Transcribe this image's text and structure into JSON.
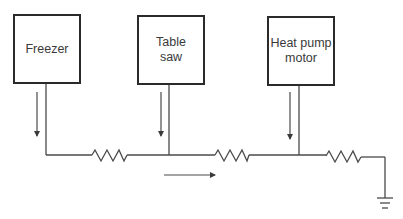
{
  "diagram": {
    "type": "circuit-schematic",
    "colors": {
      "line": "#4a4a4a",
      "box_border": "#2a2a2a",
      "text": "#3a3a3a",
      "background": "#ffffff"
    },
    "devices": [
      {
        "id": "freezer",
        "label": "Freezer",
        "box": {
          "x": 13,
          "y": 14,
          "w": 68,
          "h": 70
        },
        "wire_x": 46,
        "arrow_x": 37
      },
      {
        "id": "table-saw",
        "label": "Table\nsaw",
        "box": {
          "x": 137,
          "y": 15,
          "w": 68,
          "h": 70
        },
        "wire_x": 169,
        "arrow_x": 161
      },
      {
        "id": "heat-pump-motor",
        "label": "Heat pump\nmotor",
        "box": {
          "x": 267,
          "y": 16,
          "w": 68,
          "h": 70
        },
        "wire_x": 299,
        "arrow_x": 290
      }
    ],
    "resistors": [
      {
        "id": "r1",
        "x_start": 92,
        "x_end": 127
      },
      {
        "id": "r2",
        "x_start": 215,
        "x_end": 249
      },
      {
        "id": "r3",
        "x_start": 326,
        "x_end": 361
      }
    ],
    "bus_y": 155,
    "right_x": 385,
    "ground": {
      "x": 385,
      "y": 198
    },
    "current_arrow": {
      "x_start": 164,
      "x_end": 215,
      "y": 175,
      "direction": "right"
    },
    "downward_arrows": {
      "y_start": 92,
      "y_end": 136
    }
  }
}
